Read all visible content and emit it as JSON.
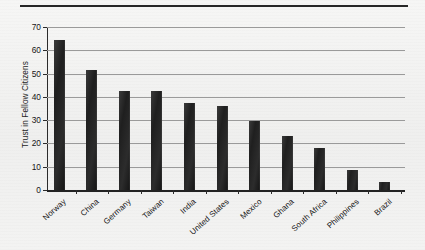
{
  "chart_data": {
    "type": "bar",
    "title": "",
    "xlabel": "",
    "ylabel": "Trust in Fellow Citizens",
    "ylim": [
      0,
      70
    ],
    "yticks": [
      0,
      10,
      20,
      30,
      40,
      50,
      60,
      70
    ],
    "ytick_labels": [
      "0",
      "10",
      "20",
      "30",
      "40",
      "50",
      "60",
      "70"
    ],
    "grid": true,
    "legend": false,
    "bar_color": "#222222",
    "categories": [
      "Norway",
      "China",
      "Germany",
      "Taiwan",
      "India",
      "United States",
      "Mexico",
      "Ghana",
      "South Africa",
      "Philippines",
      "Brazil"
    ],
    "values": [
      64.5,
      51.5,
      42.5,
      42.5,
      37.5,
      36,
      29.5,
      23,
      18,
      8.5,
      3.5
    ]
  },
  "figure": {
    "top_rule_color": "#272727",
    "background_color": "#f3f3f2"
  }
}
